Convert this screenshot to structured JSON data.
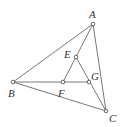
{
  "diagram": {
    "type": "geometry",
    "points": [
      {
        "name": "A",
        "x": 93,
        "y": 24,
        "label_x": 89,
        "label_y": 18
      },
      {
        "name": "B",
        "x": 13,
        "y": 82,
        "label_x": 8,
        "label_y": 97
      },
      {
        "name": "C",
        "x": 106,
        "y": 111,
        "label_x": 109,
        "label_y": 122
      },
      {
        "name": "E",
        "x": 76,
        "y": 57,
        "label_x": 64,
        "label_y": 58
      },
      {
        "name": "F",
        "x": 63,
        "y": 82,
        "label_x": 58,
        "label_y": 97
      },
      {
        "name": "G",
        "x": 89,
        "y": 82,
        "label_x": 91,
        "label_y": 80
      }
    ],
    "segments": [
      [
        "A",
        "B"
      ],
      [
        "A",
        "C"
      ],
      [
        "B",
        "C"
      ],
      [
        "B",
        "G"
      ],
      [
        "A",
        "F"
      ],
      [
        "E",
        "C"
      ]
    ],
    "labels": {
      "A": "A",
      "B": "B",
      "C": "C",
      "E": "E",
      "F": "F",
      "G": "G"
    },
    "stroke_color": "#555555"
  }
}
